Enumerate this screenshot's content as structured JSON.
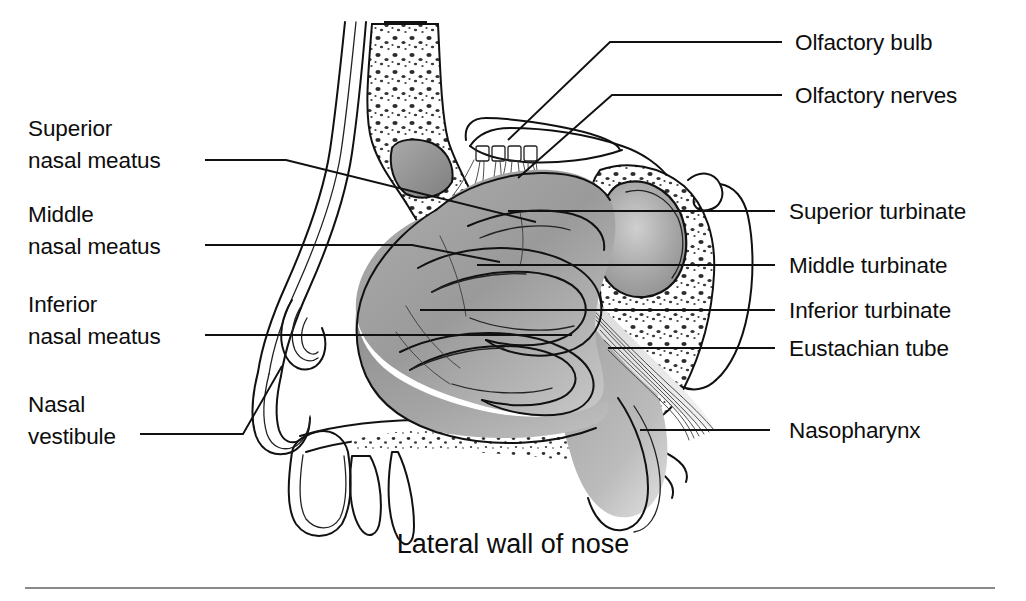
{
  "figure": {
    "caption": "Lateral wall of nose",
    "title": "Lateral wall of nose",
    "background_color": "#ffffff",
    "ink_color": "#111111"
  },
  "labels_left": [
    {
      "id": "superior-nasal-meatus",
      "line1": "Superior",
      "line2": "nasal meatus"
    },
    {
      "id": "middle-nasal-meatus",
      "line1": "Middle",
      "line2": "nasal meatus"
    },
    {
      "id": "inferior-nasal-meatus",
      "line1": "Inferior",
      "line2": "nasal meatus"
    },
    {
      "id": "nasal-vestibule",
      "line1": "Nasal",
      "line2": "vestibule"
    }
  ],
  "labels_right": [
    {
      "id": "olfactory-bulb",
      "text": "Olfactory bulb"
    },
    {
      "id": "olfactory-nerves",
      "text": "Olfactory nerves"
    },
    {
      "id": "superior-turbinate",
      "text": "Superior turbinate"
    },
    {
      "id": "middle-turbinate",
      "text": "Middle turbinate"
    },
    {
      "id": "inferior-turbinate",
      "text": "Inferior turbinate"
    },
    {
      "id": "eustachian-tube",
      "text": "Eustachian tube"
    },
    {
      "id": "nasopharynx",
      "text": "Nasopharynx"
    }
  ]
}
